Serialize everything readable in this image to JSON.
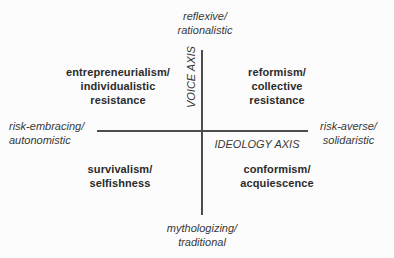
{
  "diagram": {
    "axes": {
      "vertical": {
        "name": "VOICE AXIS",
        "top_pole": "reflexive/\nrationalistic",
        "bottom_pole": "mythologizing/\ntraditional"
      },
      "horizontal": {
        "name": "IDEOLOGY AXIS",
        "left_pole": "risk-embracing/\nautonomistic",
        "right_pole": "risk-averse/\nsolidaristic"
      }
    },
    "quadrants": {
      "top_left": "entrepreneurialism/\nindividualistic\nresistance",
      "top_right": "reformism/\ncollective\nresistance",
      "bottom_left": "survivalism/\nselfishness",
      "bottom_right": "conformism/\nacquiescence"
    },
    "colors": {
      "text": "#2b2b2b",
      "line": "#4d4d4d",
      "background": "#fcfcfc"
    }
  }
}
